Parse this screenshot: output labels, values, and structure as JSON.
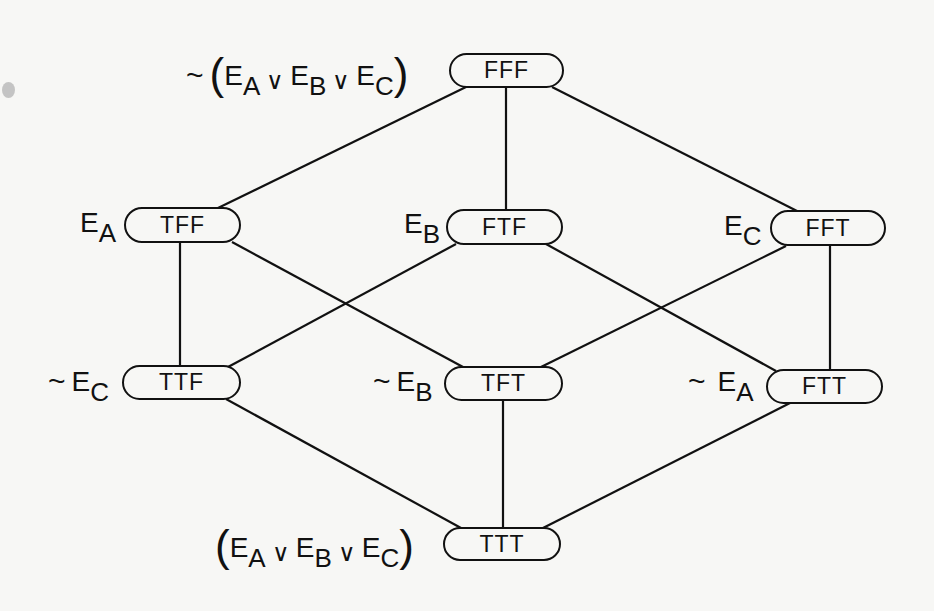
{
  "diagram": {
    "nodes": {
      "FFF": {
        "assignment": "FFF",
        "label_prefix": "~",
        "label": "(E_A ∨ E_B ∨ E_C)",
        "x": 449,
        "y": 53,
        "w": 115,
        "h": 35
      },
      "TFF": {
        "assignment": "TFF",
        "label": "E_A",
        "x": 124,
        "y": 207,
        "w": 117,
        "h": 36
      },
      "FTF": {
        "assignment": "FTF",
        "label": "E_B",
        "x": 446,
        "y": 209,
        "w": 117,
        "h": 36
      },
      "FFT": {
        "assignment": "FFT",
        "label": "E_C",
        "x": 770,
        "y": 210,
        "w": 116,
        "h": 36
      },
      "TTF": {
        "assignment": "TTF",
        "label_prefix": "~",
        "label": "E_C",
        "x": 122,
        "y": 365,
        "w": 119,
        "h": 35
      },
      "TFT": {
        "assignment": "TFT",
        "label_prefix": "~",
        "label": "E_B",
        "x": 444,
        "y": 366,
        "w": 119,
        "h": 35
      },
      "FTT": {
        "assignment": "FTT",
        "label_prefix": "~",
        "label": "E_A",
        "x": 766,
        "y": 369,
        "w": 117,
        "h": 35
      },
      "TTT": {
        "assignment": "TTT",
        "label": "(E_A ∨ E_B ∨ E_C)",
        "x": 443,
        "y": 527,
        "w": 118,
        "h": 34
      }
    },
    "label_parts": {
      "E": "E",
      "A": "A",
      "B": "B",
      "C": "C",
      "tilde": "~",
      "or": "∨",
      "lparen": "(",
      "rparen": ")"
    },
    "edges": [
      {
        "from": "FFF",
        "to": "TFF",
        "x1": 466,
        "y1": 87,
        "x2": 218,
        "y2": 208
      },
      {
        "from": "FFF",
        "to": "FTF",
        "x1": 506,
        "y1": 87,
        "x2": 506,
        "y2": 209
      },
      {
        "from": "FFF",
        "to": "FFT",
        "x1": 552,
        "y1": 87,
        "x2": 797,
        "y2": 211
      },
      {
        "from": "TFF",
        "to": "TTF",
        "x1": 180,
        "y1": 243,
        "x2": 180,
        "y2": 365
      },
      {
        "from": "TFF",
        "to": "TFT",
        "x1": 232,
        "y1": 242,
        "x2": 463,
        "y2": 367
      },
      {
        "from": "FTF",
        "to": "TTF",
        "x1": 456,
        "y1": 244,
        "x2": 228,
        "y2": 367
      },
      {
        "from": "FTF",
        "to": "FTT",
        "x1": 546,
        "y1": 244,
        "x2": 776,
        "y2": 371
      },
      {
        "from": "FFT",
        "to": "TFT",
        "x1": 786,
        "y1": 246,
        "x2": 541,
        "y2": 367
      },
      {
        "from": "FFT",
        "to": "FTT",
        "x1": 830,
        "y1": 246,
        "x2": 830,
        "y2": 369
      },
      {
        "from": "TTF",
        "to": "TTT",
        "x1": 226,
        "y1": 399,
        "x2": 461,
        "y2": 528
      },
      {
        "from": "TFT",
        "to": "TTT",
        "x1": 503,
        "y1": 401,
        "x2": 503,
        "y2": 527
      },
      {
        "from": "FTT",
        "to": "TTT",
        "x1": 790,
        "y1": 403,
        "x2": 543,
        "y2": 528
      }
    ]
  }
}
